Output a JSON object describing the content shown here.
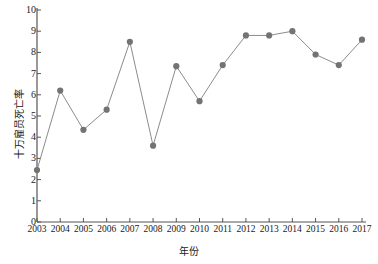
{
  "chart_data": {
    "type": "line",
    "title": "",
    "xlabel": "年份",
    "ylabel": "十万雇员死亡率",
    "categories": [
      "2003",
      "2004",
      "2005",
      "2006",
      "2007",
      "2008",
      "2009",
      "2010",
      "2011",
      "2012",
      "2013",
      "2014",
      "2015",
      "2016",
      "2017"
    ],
    "values": [
      2.45,
      6.2,
      4.35,
      5.3,
      8.5,
      3.6,
      7.35,
      5.7,
      7.4,
      8.8,
      8.8,
      9.0,
      7.9,
      7.4,
      8.6
    ],
    "series": [
      {
        "name": "十万雇员死亡率",
        "values": [
          2.45,
          6.2,
          4.35,
          5.3,
          8.5,
          3.6,
          7.35,
          5.7,
          7.4,
          8.8,
          8.8,
          9.0,
          7.9,
          7.4,
          8.6
        ]
      }
    ],
    "ylim": [
      0,
      10
    ],
    "yticks": [
      0,
      1,
      2,
      3,
      4,
      5,
      6,
      7,
      8,
      9,
      10
    ],
    "ytick_labels": [
      "0",
      "1",
      "2",
      "3",
      "4",
      "5",
      "6",
      "7",
      "8",
      "9",
      "10"
    ],
    "xtick_labels": [
      "2003",
      "2004",
      "2005",
      "2006",
      "2007",
      "2008",
      "2009",
      "2010",
      "2011",
      "2012",
      "2013",
      "2014",
      "2015",
      "2016",
      "2017"
    ],
    "grid": false,
    "legend": null,
    "marker": "circle",
    "marker_color": "#737373",
    "line_color": "#8c8c8c",
    "axis_color": "#555555",
    "background": "#ffffff"
  }
}
